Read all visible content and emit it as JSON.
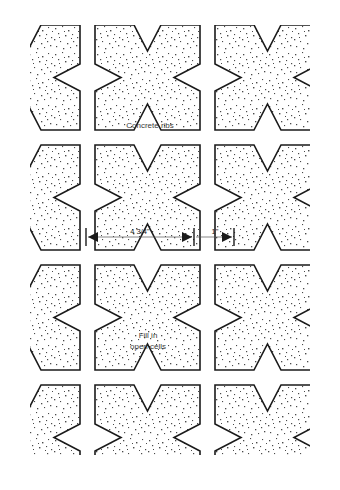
{
  "figure": {
    "type": "technical-plan-diagram",
    "background_color": "#ffffff",
    "line_color": "#1a1a1a",
    "fill_pattern": "stipple",
    "stipple_color": "#444444"
  },
  "labels": {
    "concrete_ribs": "Concrete ribs",
    "fill_open_cells_line1": "Fill in",
    "fill_open_cells_line2": "open cells"
  },
  "dimensions": [
    {
      "name": "block-width",
      "value": "4 3/4\""
    },
    {
      "name": "rib-gap",
      "value": "1\""
    }
  ],
  "geometry": {
    "clip": {
      "x": 30,
      "y": 25,
      "width": 280,
      "height": 430
    },
    "grid": {
      "pitch_x": 120,
      "pitch_y": 120,
      "block_size": 105,
      "notch_depth": 26,
      "origin_x": -25,
      "origin_y": -95
    },
    "block_description": "square with V-notch cut into each of the four edges"
  }
}
